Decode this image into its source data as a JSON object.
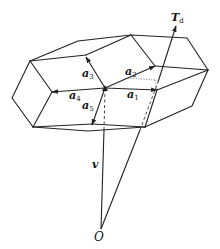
{
  "figure": {
    "type": "crystal-lattice-vector-diagram",
    "labels": {
      "a1": {
        "base": "a",
        "sub": "1"
      },
      "a2": {
        "base": "a",
        "sub": "2"
      },
      "a3": {
        "base": "a",
        "sub": "3"
      },
      "a4": {
        "base": "a",
        "sub": "4"
      },
      "a5": {
        "base": "a",
        "sub": "5"
      },
      "Td": {
        "base": "T",
        "sub": "d"
      },
      "v": "v",
      "O": "O"
    },
    "colors": {
      "line": "#222222",
      "background": "#ffffff"
    }
  }
}
